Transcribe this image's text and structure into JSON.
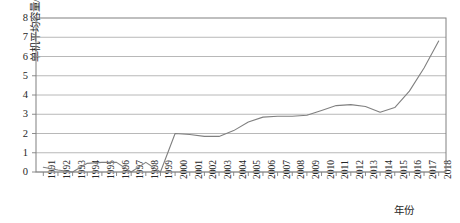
{
  "chart_data": {
    "type": "line",
    "title": "",
    "xlabel": "年份",
    "ylabel": "单机平均容量/MW",
    "ylim": [
      0,
      8
    ],
    "yticks": [
      "0",
      "1",
      "2",
      "3",
      "4",
      "5",
      "6",
      "7",
      "8"
    ],
    "grid": true,
    "legend": "none",
    "series_color": "#808080",
    "categories": [
      "1991",
      "1992",
      "1993",
      "1994",
      "1995",
      "1996",
      "1997",
      "1998",
      "1999",
      "2000",
      "2001",
      "2002",
      "2003",
      "2004",
      "2005",
      "2006",
      "2007",
      "2008",
      "2009",
      "2010",
      "2011",
      "2012",
      "2013",
      "2014",
      "2015",
      "2016",
      "2017",
      "2018"
    ],
    "x": [
      1991,
      1992,
      1993,
      1994,
      1995,
      1996,
      1997,
      1998,
      1999,
      2000,
      2001,
      2002,
      2003,
      2004,
      2005,
      2006,
      2007,
      2008,
      2009,
      2010,
      2011,
      2012,
      2013,
      2014,
      2015,
      2016,
      2017,
      2018
    ],
    "values": [
      0.25,
      0.1,
      0.0,
      0.45,
      0.5,
      0.5,
      0.0,
      0.5,
      0.0,
      2.0,
      1.95,
      1.85,
      1.85,
      2.15,
      2.6,
      2.85,
      2.9,
      2.9,
      2.95,
      3.2,
      3.45,
      3.5,
      3.4,
      3.1,
      3.35,
      4.2,
      5.4,
      6.8
    ],
    "series": [
      {
        "name": "单机平均容量",
        "values": [
          0.25,
          0.1,
          0.0,
          0.45,
          0.5,
          0.5,
          0.0,
          0.5,
          0.0,
          2.0,
          1.95,
          1.85,
          1.85,
          2.15,
          2.6,
          2.85,
          2.9,
          2.9,
          2.95,
          3.2,
          3.45,
          3.5,
          3.4,
          3.1,
          3.35,
          4.2,
          5.4,
          6.8
        ]
      }
    ]
  },
  "style": {
    "plot_border_color": "#808080",
    "grid_color": "#a6a6a6",
    "axis_text_color": "#262626"
  }
}
